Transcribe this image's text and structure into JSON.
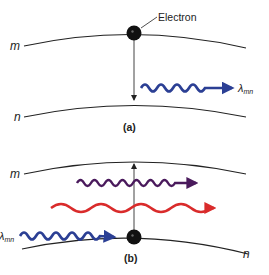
{
  "panel_a": {
    "level_upper": "m",
    "level_lower": "n",
    "electron_label": "Electron",
    "photon_label_main": "λ",
    "photon_label_sub": "mn",
    "caption": "(a)",
    "photon_color": "#2b3f94"
  },
  "panel_b": {
    "level_upper": "m",
    "level_lower": "n",
    "photon_label_main": "λ",
    "photon_label_sub": "mn",
    "caption": "(b)",
    "photon_colors": {
      "incident": "#2b3f94",
      "purple": "#4a1a5c",
      "red": "#d92b2b"
    }
  }
}
